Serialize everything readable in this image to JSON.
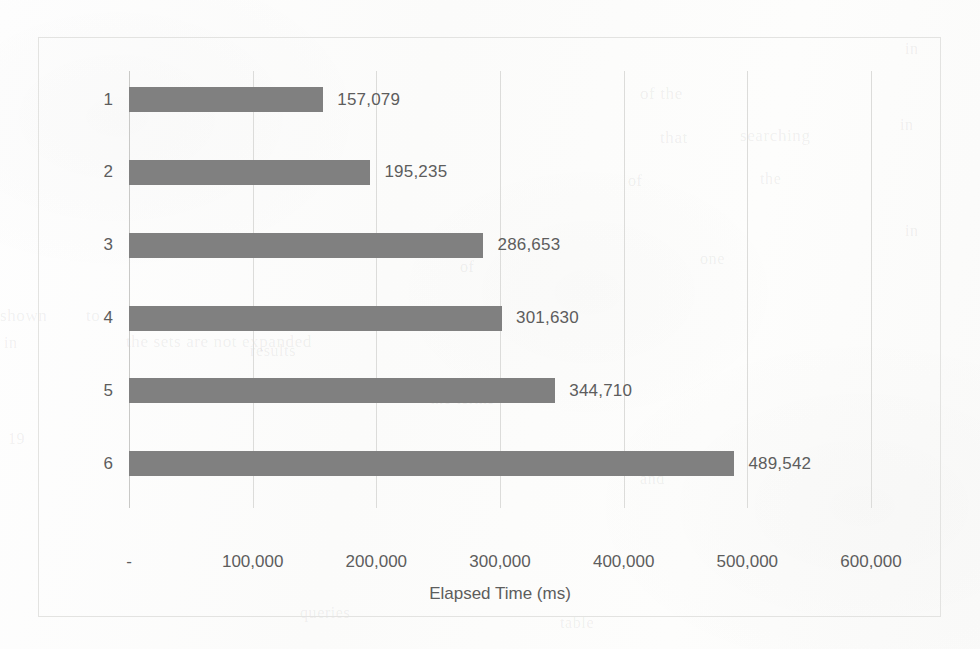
{
  "chart_data": {
    "type": "bar",
    "orientation": "horizontal",
    "title": "",
    "xlabel": "Elapsed Time (ms)",
    "ylabel": "Number of search terms",
    "categories": [
      "1",
      "2",
      "3",
      "4",
      "5",
      "6"
    ],
    "values": [
      157079,
      195235,
      286653,
      301630,
      344710,
      489542
    ],
    "value_labels": [
      "157,079",
      "195,235",
      "286,653",
      "301,630",
      "344,710",
      "489,542"
    ],
    "xlim": [
      0,
      600000
    ],
    "xticks": [
      0,
      100000,
      200000,
      300000,
      400000,
      500000,
      600000
    ],
    "xtick_labels": [
      "-",
      "100,000",
      "200,000",
      "300,000",
      "400,000",
      "500,000",
      "600,000"
    ],
    "grid": "vertical",
    "legend": "none",
    "series": [
      {
        "name": "Elapsed Time (ms)",
        "values": [
          157079,
          195235,
          286653,
          301630,
          344710,
          489542
        ],
        "color": "#808080"
      }
    ],
    "colors": {
      "bar": "#808080",
      "text": "#5d5d5d",
      "gridline": "#dcdcda",
      "border": "#e3e3e1",
      "background": "#fdfdfc"
    }
  },
  "bleed_through": [
    {
      "text": "of the",
      "left": 640,
      "top": 84,
      "size": 17,
      "rotate": 0
    },
    {
      "text": "in",
      "left": 905,
      "top": 40,
      "size": 16,
      "rotate": 0
    },
    {
      "text": "that",
      "left": 660,
      "top": 128,
      "size": 17,
      "rotate": 0
    },
    {
      "text": "searching",
      "left": 740,
      "top": 126,
      "size": 17,
      "rotate": 0
    },
    {
      "text": "in",
      "left": 900,
      "top": 116,
      "size": 16,
      "rotate": 0
    },
    {
      "text": "of",
      "left": 628,
      "top": 172,
      "size": 16,
      "rotate": 0
    },
    {
      "text": "the",
      "left": 760,
      "top": 170,
      "size": 16,
      "rotate": 0
    },
    {
      "text": "shown",
      "left": 0,
      "top": 306,
      "size": 17,
      "rotate": 0
    },
    {
      "text": "to",
      "left": 86,
      "top": 306,
      "size": 17,
      "rotate": 0
    },
    {
      "text": "from the rows of the table",
      "left": 130,
      "top": 304,
      "size": 17,
      "rotate": 0
    },
    {
      "text": "in",
      "left": 4,
      "top": 334,
      "size": 16,
      "rotate": 0
    },
    {
      "text": "the sets are not expanded",
      "left": 126,
      "top": 332,
      "size": 17,
      "rotate": 0
    },
    {
      "text": "19",
      "left": 8,
      "top": 430,
      "size": 16,
      "rotate": 0
    },
    {
      "text": "results",
      "left": 250,
      "top": 342,
      "size": 16,
      "rotate": 0
    },
    {
      "text": "of",
      "left": 460,
      "top": 258,
      "size": 16,
      "rotate": 0
    },
    {
      "text": "one",
      "left": 700,
      "top": 250,
      "size": 16,
      "rotate": 0
    },
    {
      "text": "in",
      "left": 905,
      "top": 222,
      "size": 16,
      "rotate": 0
    },
    {
      "text": "the terms",
      "left": 430,
      "top": 390,
      "size": 16,
      "rotate": 0
    },
    {
      "text": "queries",
      "left": 300,
      "top": 604,
      "size": 16,
      "rotate": 0
    },
    {
      "text": "table",
      "left": 560,
      "top": 614,
      "size": 16,
      "rotate": 0
    },
    {
      "text": "and",
      "left": 640,
      "top": 470,
      "size": 16,
      "rotate": 0
    }
  ]
}
